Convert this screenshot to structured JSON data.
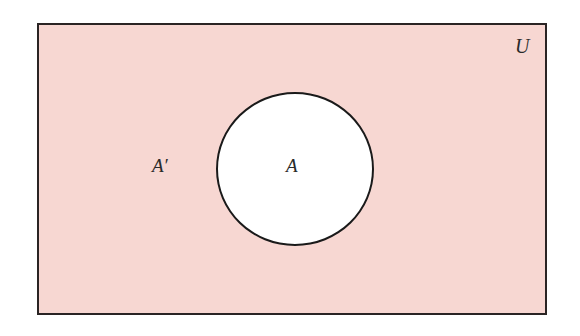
{
  "diagram": {
    "type": "venn",
    "universe_label": "U",
    "set_label": "A",
    "complement_label": "A′",
    "colors": {
      "universe_fill": "#f7d7d2",
      "set_fill": "#ffffff",
      "stroke": "#1a1a1a"
    }
  }
}
